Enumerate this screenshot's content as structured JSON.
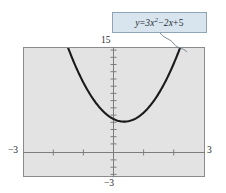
{
  "figure": {
    "type": "graph-illustration",
    "background_color": "#ffffff",
    "plot_background_color": "#e3e3e3",
    "frame_color": "#8b8b8b",
    "curve_color": "#1a1a1a",
    "callout": {
      "equation_display": "y = 3x² − 2x + 5",
      "lhs": "y",
      "equals": "=",
      "term1_coefficient": "3",
      "term1_variable": "x",
      "term1_exponent": "2",
      "operator1": "−",
      "term2_coefficient": "2",
      "term2_variable": "x",
      "operator2": "+",
      "constant": "5",
      "box_fill": "#d9e5ee",
      "box_border": "#8fa4b4"
    },
    "axes": {
      "x_min_label": "−3",
      "x_max_label": "3",
      "y_min_label": "−3",
      "y_max_label": "15"
    }
  },
  "chart_data": {
    "type": "line",
    "title": "",
    "subtitle": "",
    "xlabel": "",
    "ylabel": "",
    "equation": "y = 3x^2 - 2x + 5",
    "function": "quadratic",
    "coefficients": {
      "a": 3,
      "b": -2,
      "c": 5
    },
    "vertex": {
      "x": 0.333,
      "y": 4.667
    },
    "xlim": [
      -3,
      3
    ],
    "ylim": [
      -3,
      15
    ],
    "x_tick_labels": [
      "−3",
      "3"
    ],
    "y_tick_labels": [
      "−3",
      "15"
    ],
    "x_tick_interval": 1,
    "y_tick_interval": 1,
    "grid": false,
    "legend": "none",
    "annotations": [
      "y = 3x² − 2x + 5"
    ],
    "x": [
      -1.7,
      -1.5,
      -1.25,
      -1.0,
      -0.75,
      -0.5,
      -0.25,
      0,
      0.25,
      0.333,
      0.5,
      0.75,
      1.0,
      1.25,
      1.5,
      1.75,
      1.9
    ],
    "y": [
      17.07,
      14.75,
      12.19,
      10.0,
      8.19,
      6.75,
      5.69,
      5.0,
      4.69,
      4.67,
      4.75,
      5.19,
      6.0,
      7.19,
      8.75,
      10.69,
      12.03
    ]
  }
}
